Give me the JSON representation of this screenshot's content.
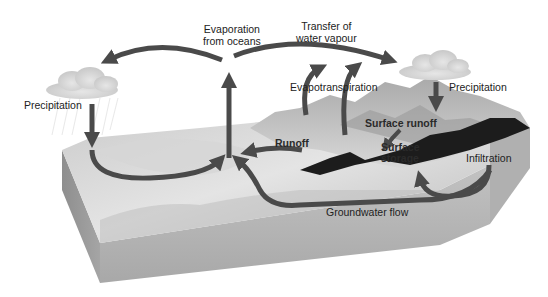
{
  "figure": {
    "top_cut_text": "The cut-off line of text above figure",
    "colors": {
      "arrow": "#4a4a4a",
      "block_top": "#cfcfcf",
      "block_side": "#b5b5b5",
      "block_front": "#9e9e9e",
      "terrain_dark": "#1c1c1c",
      "cloud": "#dcdcdc"
    },
    "labels": {
      "evaporation_line1": "Evaporation",
      "evaporation_line2": "from oceans",
      "transfer_line1": "Transfer of",
      "transfer_line2": "water vapour",
      "precipitation_left": "Precipitation",
      "precipitation_right": "Precipitation",
      "evapotranspiration": "Evapotranspiration",
      "surface_runoff": "Surface runoff",
      "runoff": "Runoff",
      "surface_storage_line1": "Surface",
      "surface_storage_line2": "storage",
      "infiltration": "Infiltration",
      "groundwater_flow": "Groundwater flow"
    }
  }
}
